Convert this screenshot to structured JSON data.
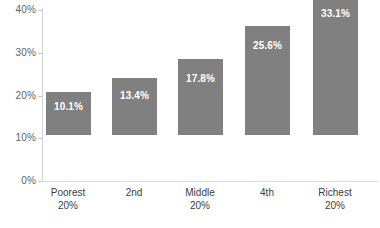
{
  "chart_data": {
    "type": "bar",
    "title": "",
    "xlabel": "",
    "ylabel": "",
    "categories": [
      "Poorest 20%",
      "2nd",
      "Middle 20%",
      "4th",
      "Richest 20%"
    ],
    "category_lines": [
      [
        "Poorest",
        "20%"
      ],
      [
        "2nd",
        ""
      ],
      [
        "Middle",
        "20%"
      ],
      [
        "4th",
        ""
      ],
      [
        "Richest",
        "20%"
      ]
    ],
    "values": [
      10.1,
      13.4,
      17.8,
      25.6,
      33.1
    ],
    "value_labels": [
      "10.1%",
      "13.4%",
      "17.8%",
      "25.6%",
      "33.1%"
    ],
    "ylim": [
      0,
      40
    ],
    "ytick_values": [
      0,
      10,
      20,
      30,
      40
    ],
    "ytick_labels": [
      "0%",
      "10%",
      "20%",
      "30%",
      "40%"
    ],
    "grid": false,
    "legend": null,
    "bar_color": "#808080",
    "value_label_color": "#ffffff",
    "axis_color": "#d4d4d4",
    "tick_label_color": "#5f5f5f",
    "category_label_color": "#3c3c3c",
    "background_color": "#ffffff"
  }
}
